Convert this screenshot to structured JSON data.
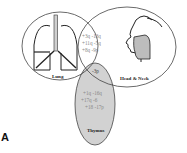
{
  "figure": {
    "panel_label": "A",
    "sets": [
      {
        "name": "Lung",
        "icon": "lungs-icon"
      },
      {
        "name": "Head & Neck",
        "icon": "head-profile-icon"
      },
      {
        "name": "Thymus",
        "icon": null
      }
    ],
    "regions": {
      "lung_headneck": {
        "lines": [
          "+3q  -13q",
          "+11q   -5q",
          "+8q   -9p"
        ]
      },
      "all_three": {
        "lines": [
          "-3p"
        ]
      },
      "thymus_only": {
        "lines": [
          "+1q  -16q",
          "+17q     -6",
          "+18  -17p"
        ]
      }
    },
    "colors": {
      "outline": "#333333",
      "thymus_fill": "#cfcfcf",
      "face_fill": "#bdbdbd",
      "text_gray": "#888888"
    }
  }
}
